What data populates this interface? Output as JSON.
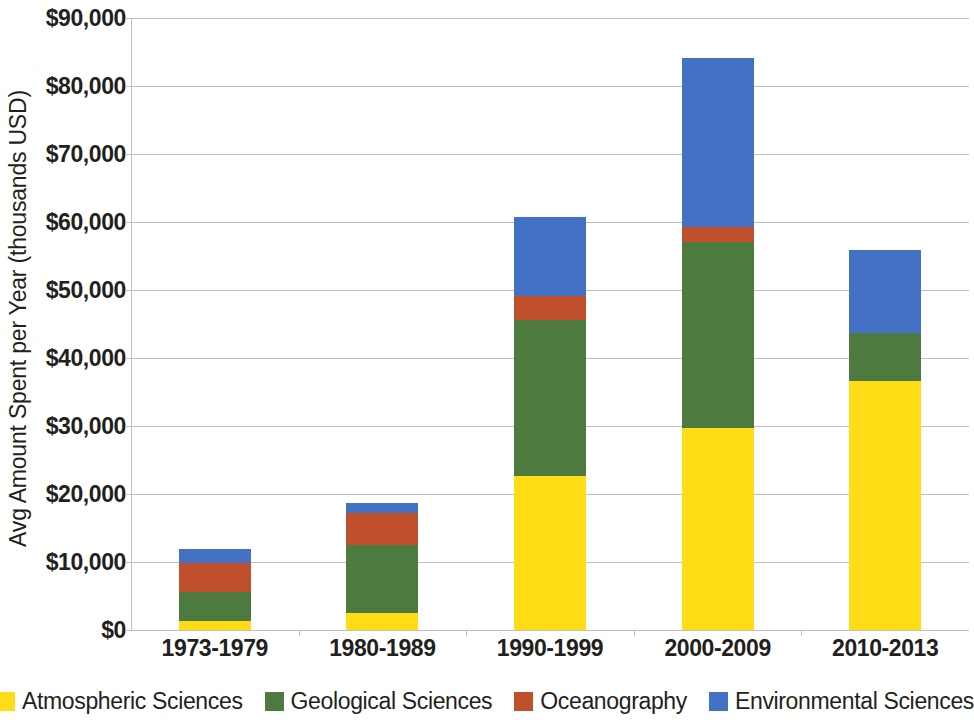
{
  "chart_data": {
    "type": "bar",
    "stacked": true,
    "title": "",
    "xlabel": "",
    "ylabel": "Avg Amount Spent per Year (thousands USD)",
    "categories": [
      "1973-1979",
      "1980-1989",
      "1990-1999",
      "2000-2009",
      "2010-2013"
    ],
    "ylim": [
      0,
      90000
    ],
    "ytick_values": [
      0,
      10000,
      20000,
      30000,
      40000,
      50000,
      60000,
      70000,
      80000,
      90000
    ],
    "ytick_labels": [
      "$0",
      "$10,000",
      "$20,000",
      "$30,000",
      "$40,000",
      "$50,000",
      "$60,000",
      "$70,000",
      "$80,000",
      "$90,000"
    ],
    "grid": true,
    "legend_position": "bottom",
    "series": [
      {
        "name": "Atmospheric Sciences",
        "color": "#FFDD16",
        "values": [
          1300,
          2500,
          22650,
          29700,
          36600
        ]
      },
      {
        "name": "Geological Sciences",
        "color": "#4C7A3F",
        "values": [
          4300,
          10000,
          22950,
          27400,
          7100
        ]
      },
      {
        "name": "Oceanography",
        "color": "#C0502C",
        "values": [
          4250,
          4700,
          3500,
          2200,
          0
        ]
      },
      {
        "name": "Environmental Sciences",
        "color": "#4372C4",
        "values": [
          2050,
          1500,
          11600,
          24800,
          12200
        ]
      }
    ],
    "totals": [
      11900,
      18700,
      60700,
      84100,
      55900
    ]
  },
  "legend": {
    "items": [
      {
        "label": "Atmospheric Sciences",
        "color": "#FFDD16",
        "name": "legend-item-atmospheric-sciences"
      },
      {
        "label": "Geological Sciences",
        "color": "#4C7A3F",
        "name": "legend-item-geological-sciences"
      },
      {
        "label": "Oceanography",
        "color": "#C0502C",
        "name": "legend-item-oceanography"
      },
      {
        "label": "Environmental Sciences",
        "color": "#4372C4",
        "name": "legend-item-environmental-sciences"
      }
    ]
  },
  "axes": {
    "y_title": "Avg Amount Spent per Year (thousands USD)",
    "gridline_color": "#bfbfbf"
  }
}
